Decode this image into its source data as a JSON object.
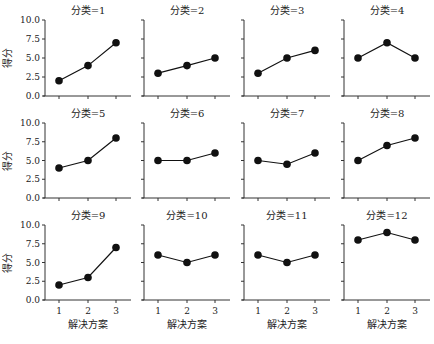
{
  "chart_data": {
    "type": "line",
    "layout": "facet-grid 3 rows x 4 columns, shared y axis on left column, shared x axis on bottom row",
    "xlabel": "解决方案",
    "ylabel": "得分",
    "x": [
      1,
      2,
      3
    ],
    "x_ticks": [
      "1",
      "2",
      "3"
    ],
    "ylim": [
      0,
      10
    ],
    "y_ticks": [
      "0.0",
      "2.5",
      "5.0",
      "7.5",
      "10.0"
    ],
    "grid": false,
    "legend": null,
    "marker": "filled circle",
    "line_color": "#111111",
    "panels": [
      {
        "title": "分类=1",
        "values": [
          2,
          4,
          7
        ]
      },
      {
        "title": "分类=2",
        "values": [
          3,
          4,
          5
        ]
      },
      {
        "title": "分类=3",
        "values": [
          3,
          5,
          6
        ]
      },
      {
        "title": "分类=4",
        "values": [
          5,
          7,
          5
        ]
      },
      {
        "title": "分类=5",
        "values": [
          4,
          5,
          8
        ]
      },
      {
        "title": "分类=6",
        "values": [
          5,
          5,
          6
        ]
      },
      {
        "title": "分类=7",
        "values": [
          5,
          4.5,
          6
        ]
      },
      {
        "title": "分类=8",
        "values": [
          5,
          7,
          8
        ]
      },
      {
        "title": "分类=9",
        "values": [
          2,
          3,
          7
        ]
      },
      {
        "title": "分类=10",
        "values": [
          6,
          5,
          6
        ]
      },
      {
        "title": "分类=11",
        "values": [
          6,
          5,
          6
        ]
      },
      {
        "title": "分类=12",
        "values": [
          8,
          9,
          8
        ]
      }
    ]
  }
}
